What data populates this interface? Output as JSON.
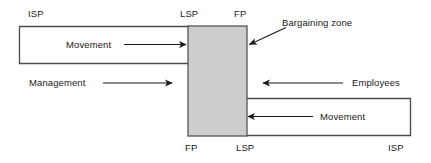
{
  "diagram": {
    "colors": {
      "stroke": "#4a4a4a",
      "arrow": "#1a1a1a",
      "zone_fill": "#cdcdcd",
      "zone_stroke": "#555555",
      "background": "#ffffff",
      "text": "#1a1a1a"
    },
    "zone": {
      "label": "Bargaining zone"
    },
    "management": {
      "party_label": "Management",
      "movement_label": "Movement",
      "start_label": "ISP",
      "target_label": "LSP",
      "limit_label": "FP"
    },
    "employees": {
      "party_label": "Employees",
      "movement_label": "Movement",
      "start_label": "ISP",
      "target_label": "LSP",
      "limit_label": "FP"
    },
    "labels": {
      "top_left_isp": "ISP",
      "top_lsp": "LSP",
      "top_fp": "FP",
      "bottom_fp": "FP",
      "bottom_lsp": "LSP",
      "bottom_right_isp": "ISP",
      "bargaining_zone": "Bargaining zone",
      "movement_top": "Movement",
      "movement_bottom": "Movement",
      "management": "Management",
      "employees": "Employees"
    }
  }
}
